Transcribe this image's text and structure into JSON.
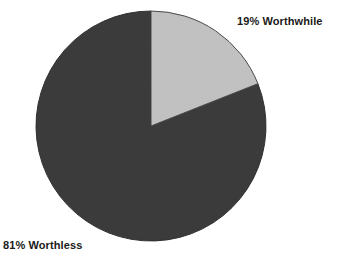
{
  "chart_data": {
    "type": "pie",
    "title": "",
    "subtitle": "",
    "xlabel": "",
    "ylabel": "",
    "grid": false,
    "legend_position": "none",
    "start_angle_deg": 0,
    "direction": "clockwise",
    "categories": [
      "Worthwhile",
      "Worthless"
    ],
    "values": [
      19,
      81
    ],
    "units": "percent",
    "labels": [
      "19% Worthwhile",
      "81% Worthless"
    ],
    "slices": [
      {
        "name": "Worthwhile",
        "value": 19,
        "label": "19% Worthwhile",
        "color": "#c3c3c3",
        "start_angle_deg": 0,
        "end_angle_deg": 68.4,
        "label_position": "top-right"
      },
      {
        "name": "Worthless",
        "value": 81,
        "label": "81% Worthless",
        "color": "#3c3c3c",
        "start_angle_deg": 68.4,
        "end_angle_deg": 360,
        "label_position": "bottom-left"
      }
    ],
    "geometry": {
      "center_x": 151,
      "center_y": 126,
      "radius": 115
    },
    "colors": {
      "background": "#ffffff",
      "outline": "#2b2b2b",
      "text": "#1a1a1a"
    }
  },
  "labels": {
    "worthwhile": "19% Worthwhile",
    "worthless": "81% Worthless"
  }
}
